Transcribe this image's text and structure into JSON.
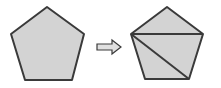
{
  "diagram": {
    "colors": {
      "fill": "#d3d3d3",
      "stroke": "#3a3a3a",
      "arrow_fill": "#e0e0e0",
      "background": "#ffffff"
    },
    "left_shape": {
      "label": "pentagon",
      "points": "47,7 84,34 72,80 25,80 11,34"
    },
    "arrow": {
      "label": "transforms-to",
      "points": "97,44 112,44 112,40 121,47 112,54 112,50 97,50"
    },
    "right_shape": {
      "label": "triangulated pentagon",
      "points": "167,7 203,34 189,79 145,79 131,34",
      "diagonals": [
        {
          "x1": 131,
          "y1": 34,
          "x2": 203,
          "y2": 34
        },
        {
          "x1": 131,
          "y1": 34,
          "x2": 189,
          "y2": 79
        }
      ]
    }
  }
}
